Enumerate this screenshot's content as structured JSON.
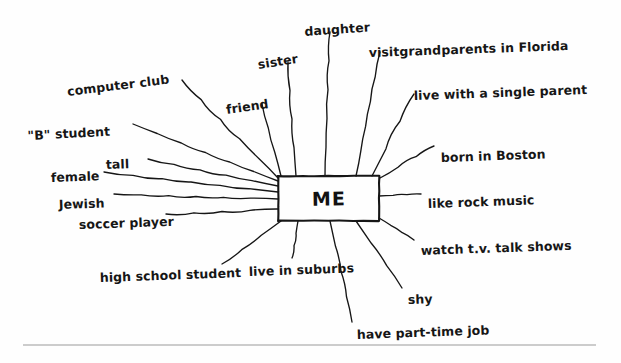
{
  "diagram": {
    "type": "cluster-web-diagram",
    "center": {
      "text": "ME",
      "x": 278,
      "y": 176,
      "width": 101,
      "height": 45
    },
    "ink_color": "#161616",
    "paper_color": "#fefefe",
    "rule_color": "#9a9a9a",
    "nodes": [
      {
        "id": "computer-club",
        "label": "computer club",
        "x": 68,
        "y": 86,
        "rotate": -7,
        "anchor_x": 182,
        "anchor_y": 80,
        "line_to_x": 278,
        "line_to_y": 178
      },
      {
        "id": "sister",
        "label": "sister",
        "x": 259,
        "y": 59,
        "rotate": -9,
        "anchor_x": 288,
        "anchor_y": 62,
        "line_to_x": 296,
        "line_to_y": 176
      },
      {
        "id": "daughter",
        "label": "daughter",
        "x": 305,
        "y": 26,
        "rotate": -4,
        "anchor_x": 330,
        "anchor_y": 32,
        "line_to_x": 325,
        "line_to_y": 176
      },
      {
        "id": "visit-grandparents",
        "label": "visitgrandparents in Florida",
        "x": 369,
        "y": 47,
        "rotate": -2,
        "anchor_x": 380,
        "anchor_y": 52,
        "line_to_x": 356,
        "line_to_y": 176
      },
      {
        "id": "live-single-parent",
        "label": "live with a single parent",
        "x": 414,
        "y": 90,
        "rotate": -2,
        "anchor_x": 414,
        "anchor_y": 94,
        "line_to_x": 372,
        "line_to_y": 176
      },
      {
        "id": "born-in-boston",
        "label": "born in Boston",
        "x": 441,
        "y": 152,
        "rotate": -2,
        "anchor_x": 434,
        "anchor_y": 146,
        "line_to_x": 380,
        "line_to_y": 178
      },
      {
        "id": "b-student",
        "label": "\"B\" student",
        "x": 28,
        "y": 130,
        "rotate": -3,
        "anchor_x": 133,
        "anchor_y": 124,
        "line_to_x": 278,
        "line_to_y": 181
      },
      {
        "id": "tall",
        "label": "tall",
        "x": 106,
        "y": 159,
        "rotate": -2,
        "anchor_x": 148,
        "anchor_y": 159,
        "line_to_x": 278,
        "line_to_y": 186
      },
      {
        "id": "female",
        "label": "female",
        "x": 51,
        "y": 172,
        "rotate": -2,
        "anchor_x": 104,
        "anchor_y": 172,
        "line_to_x": 278,
        "line_to_y": 192
      },
      {
        "id": "jewish",
        "label": "Jewish",
        "x": 59,
        "y": 199,
        "rotate": -2,
        "anchor_x": 114,
        "anchor_y": 194,
        "line_to_x": 278,
        "line_to_y": 199
      },
      {
        "id": "soccer-player",
        "label": "soccer player",
        "x": 79,
        "y": 219,
        "rotate": -2,
        "anchor_x": 166,
        "anchor_y": 214,
        "line_to_x": 278,
        "line_to_y": 209
      },
      {
        "id": "like-rock-music",
        "label": "like rock music",
        "x": 428,
        "y": 198,
        "rotate": -2,
        "anchor_x": 421,
        "anchor_y": 194,
        "line_to_x": 379,
        "line_to_y": 196
      },
      {
        "id": "watch-tv-talkshows",
        "label": "watch t.v. talk shows",
        "x": 421,
        "y": 245,
        "rotate": -2,
        "anchor_x": 414,
        "anchor_y": 240,
        "line_to_x": 379,
        "line_to_y": 218
      },
      {
        "id": "high-school-student",
        "label": "high school student",
        "x": 100,
        "y": 272,
        "rotate": -2,
        "anchor_x": 222,
        "anchor_y": 264,
        "line_to_x": 281,
        "line_to_y": 221
      },
      {
        "id": "live-in-suburbs",
        "label": "live in suburbs",
        "x": 249,
        "y": 266,
        "rotate": -2,
        "anchor_x": 292,
        "anchor_y": 258,
        "line_to_x": 298,
        "line_to_y": 221
      },
      {
        "id": "shy",
        "label": "shy",
        "x": 408,
        "y": 294,
        "rotate": -2,
        "anchor_x": 402,
        "anchor_y": 288,
        "line_to_x": 356,
        "line_to_y": 221
      },
      {
        "id": "have-part-time-job",
        "label": "have part-time job",
        "x": 357,
        "y": 329,
        "rotate": -2,
        "anchor_x": 352,
        "anchor_y": 322,
        "line_to_x": 330,
        "line_to_y": 221
      },
      {
        "id": "friend",
        "label": "friend",
        "x": 227,
        "y": 104,
        "rotate": -8,
        "anchor_x": 262,
        "anchor_y": 104,
        "line_to_x": 281,
        "line_to_y": 176
      }
    ],
    "footer_rule": {
      "x1": 23,
      "y1": 345,
      "x2": 596,
      "y2": 345
    }
  }
}
